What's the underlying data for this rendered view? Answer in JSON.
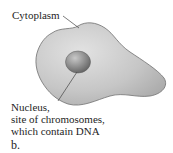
{
  "figure": {
    "labels": {
      "cytoplasm": "Cytoplasm",
      "nucleus_lines": [
        "Nucleus,",
        "site of chromosomes,",
        "which contain DNA"
      ]
    },
    "panel_label": "b.",
    "colors": {
      "cell_fill": "#c4c4c4",
      "cell_edge": "#6e6e6e",
      "nucleus_fill": "#8a8a8a",
      "leader_line": "#444444"
    }
  }
}
